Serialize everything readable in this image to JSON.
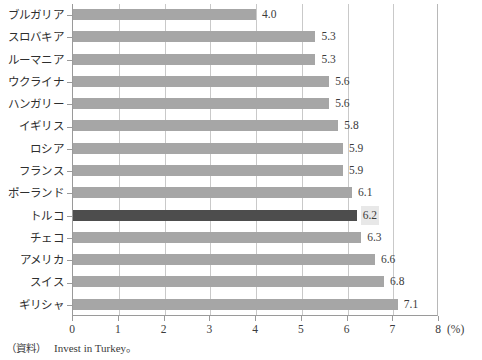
{
  "chart_data": {
    "type": "bar",
    "orientation": "horizontal",
    "title": "",
    "xlabel": "(%)",
    "ylabel": "",
    "xlim": [
      0,
      8
    ],
    "xticks": [
      "0",
      "1",
      "2",
      "3",
      "4",
      "5",
      "6",
      "7",
      "8"
    ],
    "grid": true,
    "legend": null,
    "categories": [
      "ブルガリア",
      "スロバキア",
      "ルーマニア",
      "ウクライナ",
      "ハンガリー",
      "イギリス",
      "ロシア",
      "フランス",
      "ポーランド",
      "トルコ",
      "チェコ",
      "アメリカ",
      "スイス",
      "ギリシャ"
    ],
    "values": [
      4.0,
      5.3,
      5.3,
      5.6,
      5.6,
      5.8,
      5.9,
      5.9,
      6.1,
      6.2,
      6.3,
      6.6,
      6.8,
      7.1
    ],
    "value_labels": [
      "4.0",
      "5.3",
      "5.3",
      "5.6",
      "5.6",
      "5.8",
      "5.9",
      "5.9",
      "6.1",
      "6.2",
      "6.3",
      "6.6",
      "6.8",
      "7.1"
    ],
    "highlight_index": 9,
    "highlight_category": "トルコ",
    "colors": {
      "bar": "#a6a6a6",
      "highlight_bar": "#4d4d4d",
      "gridline": "#c9c9c9",
      "axis": "#9a9a9a",
      "text": "#3b3b3b",
      "label_box": "#e8e8e8"
    }
  },
  "axis": {
    "x_unit_label": "8 (%)",
    "x_unit_suffix": "(%)"
  },
  "footer": {
    "source_prefix": "（資料）",
    "source_text": "Invest in Turkey。"
  }
}
